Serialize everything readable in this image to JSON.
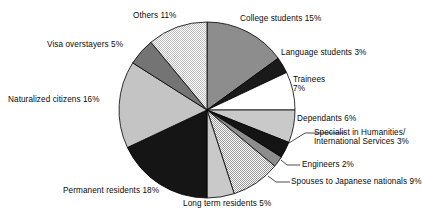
{
  "chart_data": {
    "type": "pie",
    "title": "",
    "subtitle": "",
    "xlabel": "",
    "ylabel": "",
    "legend_position": "none",
    "grid": false,
    "units": "percent",
    "start_angle_deg": 0,
    "direction": "clockwise",
    "categories": [
      "College students",
      "Language students",
      "Trainees",
      "Dependants",
      "Specialist in Humanities/International Services",
      "Engineers",
      "Spouses to Japanese nationals",
      "Long term residents",
      "Permanent residents",
      "Naturalized citizens",
      "Visa overstayers",
      "Others"
    ],
    "values": [
      15,
      3,
      7,
      6,
      3,
      2,
      9,
      5,
      18,
      16,
      5,
      11
    ],
    "total": 100,
    "slices": [
      {
        "label": "College students 15%",
        "name": "College students",
        "value": 15,
        "fill": "#8d8d8d",
        "pattern": "solid"
      },
      {
        "label": "Language students 3%",
        "name": "Language students",
        "value": 3,
        "fill": "#1a1a1a",
        "pattern": "solid"
      },
      {
        "label": "Trainees 7%",
        "name": "Trainees",
        "value": 7,
        "fill": "#ffffff",
        "pattern": "solid"
      },
      {
        "label": "Dependants 6%",
        "name": "Dependants",
        "value": 6,
        "fill": "#c9c9c9",
        "pattern": "solid"
      },
      {
        "label": "Specialist in Humanities/ International Services 3%",
        "name": "Specialist in Humanities/International Services",
        "value": 3,
        "fill": "#141414",
        "pattern": "solid"
      },
      {
        "label": "Engineers 2%",
        "name": "Engineers",
        "value": 2,
        "fill": "#8d8d8d",
        "pattern": "solid"
      },
      {
        "label": "Spouses to Japanese nationals 9%",
        "name": "Spouses to Japanese nationals",
        "value": 9,
        "fill": "#d6d6d6",
        "pattern": "checker"
      },
      {
        "label": "Long term residents 5%",
        "name": "Long term residents",
        "value": 5,
        "fill": "#c9c9c9",
        "pattern": "solid"
      },
      {
        "label": "Permanent residents 18%",
        "name": "Permanent residents",
        "value": 18,
        "fill": "#151515",
        "pattern": "solid"
      },
      {
        "label": "Naturalized citizens 16%",
        "name": "Naturalized citizens",
        "value": 16,
        "fill": "#c4c4c4",
        "pattern": "solid"
      },
      {
        "label": "Visa overstayers 5%",
        "name": "Visa overstayers",
        "value": 5,
        "fill": "#747474",
        "pattern": "solid"
      },
      {
        "label": "Others 11%",
        "name": "Others",
        "value": 11,
        "fill": "#dcdcdc",
        "pattern": "checker"
      }
    ],
    "labels": {
      "college_students": "College students 15%",
      "language_students": "Language students 3%",
      "trainees_line1": "Trainees",
      "trainees_line2": "7%",
      "dependants": "Dependants 6%",
      "specialist_line1": "Specialist in Humanities/",
      "specialist_line2": "International Services 3%",
      "engineers": "Engineers 2%",
      "spouses": "Spouses to Japanese nationals 9%",
      "long_term_residents": "Long term residents 5%",
      "permanent_residents": "Permanent residents 18%",
      "naturalized_citizens": "Naturalized citizens 16%",
      "visa_overstayers": "Visa overstayers 5%",
      "others": "Others 11%"
    },
    "colors": {
      "outline": "#000000",
      "text": "#0a0a0a",
      "background": "#ffffff"
    }
  }
}
